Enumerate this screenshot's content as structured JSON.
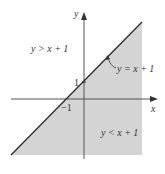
{
  "diagram": {
    "axes": {
      "x_label": "x",
      "y_label": "y",
      "tick_x": "−1",
      "tick_y": "1"
    },
    "line_label": "y = x + 1",
    "region_above_label": "y > x + 1",
    "region_below_label": "y < x + 1",
    "colors": {
      "shade": "#d4d4d4",
      "line": "#2b2b2b",
      "axis": "#555555",
      "background": "#ffffff"
    }
  }
}
